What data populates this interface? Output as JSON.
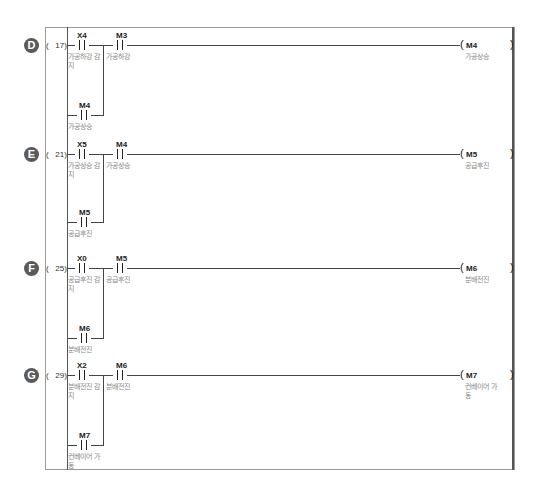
{
  "diagram": {
    "type": "ladder-logic",
    "rungs": [
      {
        "label": "D",
        "step": "(   17)",
        "contacts": [
          {
            "device": "X4",
            "comment": "가공하강 감지"
          },
          {
            "device": "M3",
            "comment": "가공하강"
          }
        ],
        "branch": {
          "device": "M4",
          "comment": "가공상승"
        },
        "coil": {
          "device": "M4",
          "comment": "가공상승"
        }
      },
      {
        "label": "E",
        "step": "(   21)",
        "contacts": [
          {
            "device": "X5",
            "comment": "가공상승 감지"
          },
          {
            "device": "M4",
            "comment": "가공상승"
          }
        ],
        "branch": {
          "device": "M5",
          "comment": "공급후진"
        },
        "coil": {
          "device": "M5",
          "comment": "공급후진"
        }
      },
      {
        "label": "F",
        "step": "(   25)",
        "contacts": [
          {
            "device": "X0",
            "comment": "공급후진 감지"
          },
          {
            "device": "M5",
            "comment": "공급후진"
          }
        ],
        "branch": {
          "device": "M6",
          "comment": "분배전진"
        },
        "coil": {
          "device": "M6",
          "comment": "분배전진"
        }
      },
      {
        "label": "G",
        "step": "(   29)",
        "contacts": [
          {
            "device": "X2",
            "comment": "분배전진 감지"
          },
          {
            "device": "M6",
            "comment": "분배전진"
          }
        ],
        "branch": {
          "device": "M7",
          "comment": "컨베이어 가동"
        },
        "coil": {
          "device": "M7",
          "comment": "컨베이어 가동"
        }
      }
    ],
    "coil_open": "(",
    "coil_close": ")"
  }
}
